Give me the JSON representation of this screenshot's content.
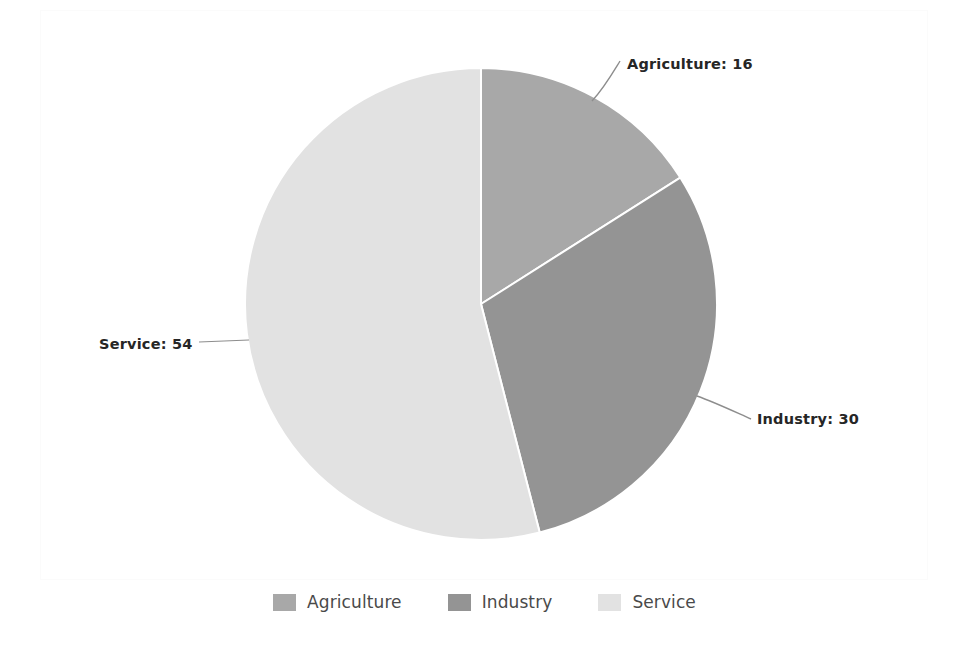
{
  "chart_data": {
    "type": "pie",
    "title": "",
    "categories": [
      "Agriculture",
      "Industry",
      "Service"
    ],
    "values": [
      16,
      30,
      54
    ],
    "labels": [
      "Agriculture: 16",
      "Industry: 30",
      "Service: 54"
    ],
    "colors": [
      "#a8a8a8",
      "#949494",
      "#e2e2e2"
    ],
    "legend_position": "bottom",
    "start_angle_deg": 0,
    "direction": "clockwise",
    "total": 100,
    "slice_separator_color": "#ffffff",
    "leader_line_color": "#8d8d8d",
    "background": "#ffffff"
  },
  "callouts": {
    "agriculture": "Agriculture: 16",
    "industry": "Industry: 30",
    "service": "Service: 54"
  },
  "legend": {
    "items": [
      {
        "label": "Agriculture",
        "color": "#a8a8a8"
      },
      {
        "label": "Industry",
        "color": "#949494"
      },
      {
        "label": "Service",
        "color": "#e2e2e2"
      }
    ]
  }
}
